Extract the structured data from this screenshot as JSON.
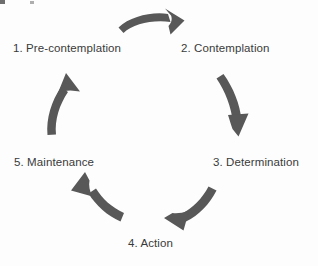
{
  "diagram": {
    "type": "cycle",
    "direction": "clockwise",
    "canvas": {
      "width": 318,
      "height": 266
    },
    "colors": {
      "background": "#fdfdfd",
      "arrow": "#585858",
      "text": "#3a3a3a"
    },
    "stages": [
      {
        "number": "1",
        "label": "1. Pre-contemplation",
        "position": "top-left"
      },
      {
        "number": "2",
        "label": "2. Contemplation",
        "position": "top-right"
      },
      {
        "number": "3",
        "label": "3. Determination",
        "position": "middle-right"
      },
      {
        "number": "4",
        "label": "4. Action",
        "position": "bottom-center"
      },
      {
        "number": "5",
        "label": "5. Maintenance",
        "position": "middle-left"
      }
    ],
    "arrows": [
      {
        "name": "arrow-precontemplation-to-contemplation",
        "from": "1. Pre-contemplation",
        "to": "2. Contemplation",
        "direction": "right"
      },
      {
        "name": "arrow-contemplation-to-determination",
        "from": "2. Contemplation",
        "to": "3. Determination",
        "direction": "down"
      },
      {
        "name": "arrow-determination-to-action",
        "from": "3. Determination",
        "to": "4. Action",
        "direction": "down-left"
      },
      {
        "name": "arrow-action-to-maintenance",
        "from": "4. Action",
        "to": "5. Maintenance",
        "direction": "up-left"
      },
      {
        "name": "arrow-maintenance-to-precontemplation",
        "from": "5. Maintenance",
        "to": "1. Pre-contemplation",
        "direction": "up"
      }
    ]
  }
}
